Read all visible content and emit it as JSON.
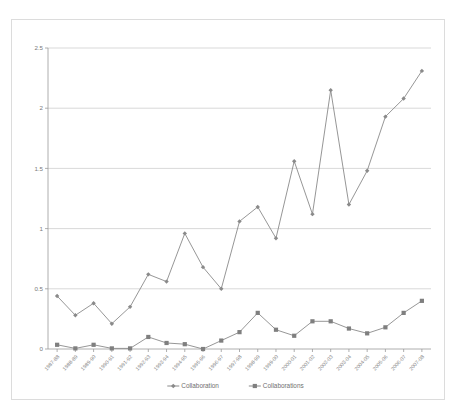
{
  "chart_data": {
    "type": "line",
    "title": "",
    "subtitle": "",
    "xlabel": "",
    "ylabel": "",
    "ylim": [
      0,
      2.5
    ],
    "y_ticks": [
      "0",
      "0.5",
      "1",
      "1.5",
      "2",
      "2.5"
    ],
    "y_tick_values": [
      0,
      0.5,
      1,
      1.5,
      2,
      2.5
    ],
    "grid": true,
    "legend_position": "bottom",
    "categories": [
      "1987-88",
      "1988-89",
      "1989-90",
      "1990-91",
      "1991-92",
      "1992-93",
      "1993-94",
      "1994-95",
      "1995-96",
      "1996-97",
      "1997-98",
      "1998-99",
      "1999-00",
      "2000-01",
      "2001-02",
      "2002-03",
      "2003-04",
      "2004-05",
      "2005-06",
      "2006-07",
      "2007-08"
    ],
    "series": [
      {
        "name": "Collaboration",
        "marker": "diamond",
        "color": "#8a8a8a",
        "values": [
          0.44,
          0.28,
          0.38,
          0.21,
          0.35,
          0.62,
          0.56,
          0.96,
          0.68,
          0.5,
          1.06,
          1.18,
          0.92,
          1.56,
          1.12,
          2.15,
          1.2,
          1.48,
          1.93,
          2.08,
          2.31
        ]
      },
      {
        "name": "Collaborations",
        "marker": "square",
        "color": "#7f7f7f",
        "values": [
          0.035,
          0.005,
          0.035,
          0.005,
          0.005,
          0.1,
          0.05,
          0.04,
          0.0,
          0.07,
          0.14,
          0.3,
          0.16,
          0.11,
          0.23,
          0.23,
          0.17,
          0.13,
          0.18,
          0.3,
          0.4
        ]
      }
    ],
    "legend": [
      {
        "label": "Collaboration",
        "marker": "diamond"
      },
      {
        "label": "Collaborations",
        "marker": "square"
      }
    ]
  }
}
